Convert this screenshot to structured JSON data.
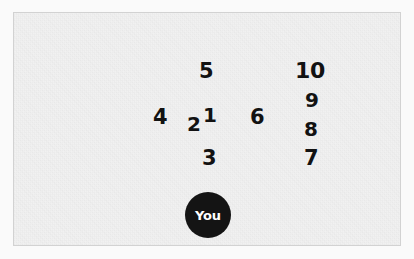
{
  "scene": {
    "background_color": "#f1f1f1",
    "outer_background_color": "#fafafa",
    "border_color": "#d2d2d2",
    "label_color": "#121212"
  },
  "you_marker": {
    "label": "You",
    "fill_color": "#141414",
    "text_color": "#ffffff",
    "center_x": 207,
    "center_y": 214,
    "diameter": 46
  },
  "nodes": [
    {
      "label": "1",
      "x": 202,
      "y": 104,
      "font_size": 20
    },
    {
      "label": "2",
      "x": 186,
      "y": 113,
      "font_size": 20
    },
    {
      "label": "3",
      "x": 201,
      "y": 147,
      "font_size": 21
    },
    {
      "label": "4",
      "x": 152,
      "y": 106,
      "font_size": 21
    },
    {
      "label": "5",
      "x": 198,
      "y": 60,
      "font_size": 21
    },
    {
      "label": "6",
      "x": 249,
      "y": 106,
      "font_size": 21
    },
    {
      "label": "7",
      "x": 303,
      "y": 147,
      "font_size": 21
    },
    {
      "label": "8",
      "x": 303,
      "y": 118,
      "font_size": 20
    },
    {
      "label": "9",
      "x": 304,
      "y": 89,
      "font_size": 20
    },
    {
      "label": "10",
      "x": 294,
      "y": 59,
      "font_size": 22
    }
  ]
}
